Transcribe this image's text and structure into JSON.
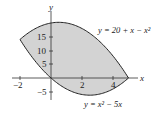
{
  "figure": {
    "type": "region-between-curves",
    "axes": {
      "x_label": "x",
      "y_label": "y",
      "x_ticks": [
        "−2",
        "2",
        "4"
      ],
      "y_ticks": [
        "15",
        "10",
        "5",
        "−5"
      ]
    },
    "curves": [
      {
        "name": "upper",
        "equation": "y = 20 + x − x²"
      },
      {
        "name": "lower",
        "equation": "y = x² − 5x"
      }
    ],
    "region": {
      "fill": "#d3d3d3",
      "x_from": -2,
      "x_to": 5
    },
    "colors": {
      "curve": "#222222",
      "fill": "#d3d3d3",
      "axis": "#333333"
    }
  },
  "labels": {
    "upper_curve_label": "y = 20 + x − x²",
    "lower_curve_label": "y = x² − 5x",
    "x_axis": "x",
    "y_axis": "y",
    "tick_x_neg2": "−2",
    "tick_x_2": "2",
    "tick_x_4": "4",
    "tick_y_15": "15",
    "tick_y_10": "10",
    "tick_y_5": "5",
    "tick_y_neg5": "−5"
  }
}
